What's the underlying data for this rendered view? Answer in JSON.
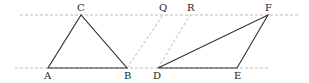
{
  "diagram": {
    "parallel_lines": [
      {
        "name": "top-line",
        "x1": 20,
        "y1": 15,
        "x2": 300,
        "y2": 15
      },
      {
        "name": "bottom-line",
        "x1": 15,
        "y1": 68,
        "x2": 270,
        "y2": 68
      }
    ],
    "triangles": [
      {
        "name": "triangle-abc",
        "points": [
          [
            48,
            68
          ],
          [
            127,
            68
          ],
          [
            81,
            15
          ]
        ]
      },
      {
        "name": "triangle-def",
        "points": [
          [
            158,
            68
          ],
          [
            237,
            68
          ],
          [
            268,
            15
          ]
        ]
      }
    ],
    "dashed_segments": [
      {
        "name": "segment-bq",
        "x1": 127,
        "y1": 68,
        "x2": 163,
        "y2": 15
      },
      {
        "name": "segment-dr",
        "x1": 158,
        "y1": 68,
        "x2": 190,
        "y2": 15
      }
    ],
    "labels": [
      {
        "id": "A",
        "text": "A",
        "x": 44,
        "y": 79
      },
      {
        "id": "B",
        "text": "B",
        "x": 124,
        "y": 79
      },
      {
        "id": "C",
        "text": "C",
        "x": 77,
        "y": 11
      },
      {
        "id": "Q",
        "text": "Q",
        "x": 159,
        "y": 11
      },
      {
        "id": "R",
        "text": "R",
        "x": 187,
        "y": 11
      },
      {
        "id": "F",
        "text": "F",
        "x": 265,
        "y": 11
      },
      {
        "id": "D",
        "text": "D",
        "x": 153,
        "y": 79
      },
      {
        "id": "E",
        "text": "E",
        "x": 234,
        "y": 79
      }
    ],
    "colors": {
      "line": "#333333",
      "dashed": "#aaaaaa"
    }
  }
}
